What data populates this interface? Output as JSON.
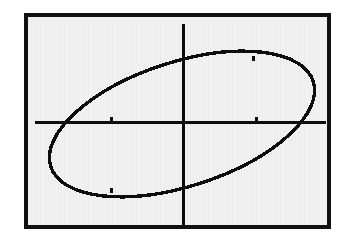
{
  "page": {
    "background_color": "#ffffff",
    "width": 352,
    "height": 252
  },
  "screen": {
    "name": "graphing-calculator-screen",
    "background_color": "#f1f1f1",
    "border_color": "#111111",
    "border_width": 4,
    "left": 24,
    "top": 13,
    "width": 307,
    "height": 216
  },
  "chart_data": {
    "type": "scatter",
    "title": "",
    "subtitle": "",
    "xlabel": "",
    "ylabel": "",
    "legend": [],
    "annotations": [],
    "grid": false,
    "tick_labels": {
      "x": [],
      "y": []
    },
    "axes": {
      "origin_px": {
        "x": 155,
        "y": 105
      },
      "x_axis": {
        "visible": true,
        "y_px": 105,
        "x_start_px": 7,
        "x_end_px": 298,
        "color": "#0d0d0d",
        "thickness_px": 3
      },
      "y_axis": {
        "visible": true,
        "x_px": 155,
        "y_start_px": 7,
        "y_end_px": 208,
        "color": "#0d0d0d",
        "thickness_px": 3
      },
      "tick_marks": [
        {
          "axis": "x",
          "x_px": 83,
          "y_px": 105,
          "label": ""
        },
        {
          "axis": "x",
          "x_px": 228,
          "y_px": 105,
          "label": ""
        }
      ],
      "curve_tick_marks": [
        {
          "x_px": 225,
          "y_px": 41,
          "label": ""
        },
        {
          "x_px": 83,
          "y_px": 173,
          "label": ""
        }
      ]
    },
    "series": [
      {
        "name": "rotated-ellipse",
        "shape": "ellipse",
        "stroke_color": "#0d0d0d",
        "stroke_width_px": 3,
        "fill": "none",
        "center_px": {
          "x": 154,
          "y": 107
        },
        "semi_major_px": 138,
        "semi_minor_px": 62,
        "rotation_deg": -18,
        "points_px": [
          {
            "x": 23,
            "y": 151
          },
          {
            "x": 27,
            "y": 135
          },
          {
            "x": 36,
            "y": 120
          },
          {
            "x": 50,
            "y": 107
          },
          {
            "x": 68,
            "y": 95
          },
          {
            "x": 90,
            "y": 83
          },
          {
            "x": 114,
            "y": 72
          },
          {
            "x": 141,
            "y": 62
          },
          {
            "x": 170,
            "y": 54
          },
          {
            "x": 201,
            "y": 48
          },
          {
            "x": 231,
            "y": 44
          },
          {
            "x": 258,
            "y": 44
          },
          {
            "x": 279,
            "y": 49
          },
          {
            "x": 290,
            "y": 59
          },
          {
            "x": 293,
            "y": 74
          },
          {
            "x": 288,
            "y": 91
          },
          {
            "x": 275,
            "y": 107
          },
          {
            "x": 257,
            "y": 121
          },
          {
            "x": 234,
            "y": 134
          },
          {
            "x": 207,
            "y": 146
          },
          {
            "x": 177,
            "y": 156
          },
          {
            "x": 146,
            "y": 164
          },
          {
            "x": 114,
            "y": 169
          },
          {
            "x": 85,
            "y": 172
          },
          {
            "x": 60,
            "y": 170
          },
          {
            "x": 41,
            "y": 165
          },
          {
            "x": 28,
            "y": 160
          },
          {
            "x": 23,
            "y": 151
          }
        ],
        "y_axis_intersections_px": [
          {
            "x": 155,
            "y": 58
          },
          {
            "x": 155,
            "y": 160
          }
        ],
        "x_axis_intersections_px": [
          {
            "x": 43,
            "y": 105
          },
          {
            "x": 277,
            "y": 105
          }
        ],
        "extents_px": {
          "leftmost": {
            "x": 22,
            "y": 152
          },
          "rightmost": {
            "x": 294,
            "y": 77
          },
          "topmost": {
            "x": 236,
            "y": 43
          },
          "bottommost": {
            "x": 90,
            "y": 172
          }
        }
      }
    ]
  }
}
